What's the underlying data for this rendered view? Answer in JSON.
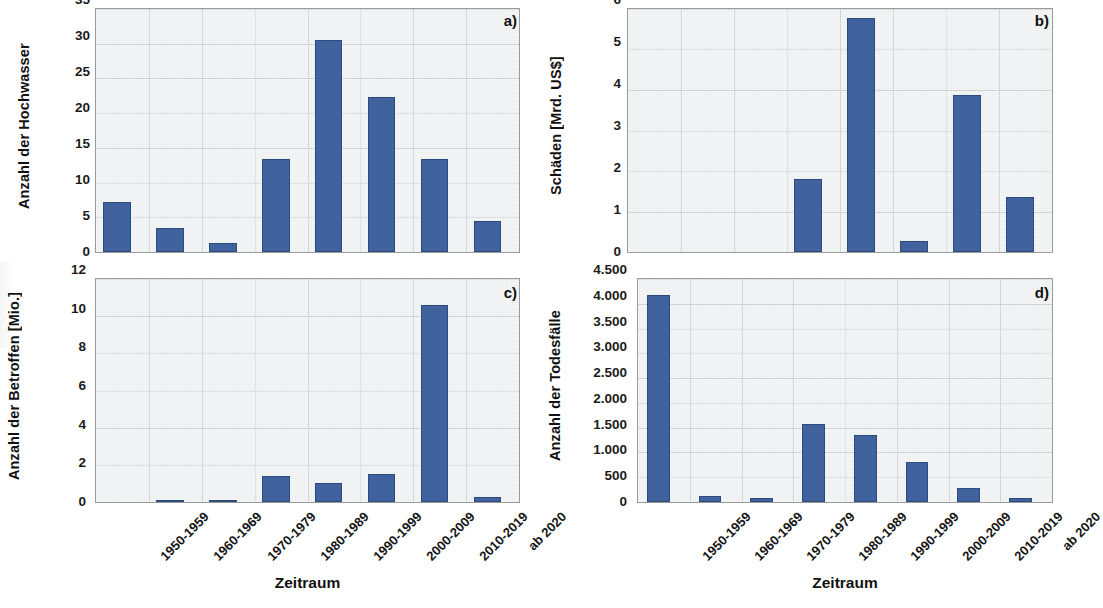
{
  "figure": {
    "bar_color": "#40639f",
    "bar_edge_color": "#2d4a7c",
    "plot_background": "#eceeef",
    "grid_color": "#c9cbcc",
    "categories": [
      "1950-1959",
      "1960-1969",
      "1970-1979",
      "1980-1989",
      "1990-1999",
      "2000-2009",
      "2010-2019",
      "ab 2020"
    ]
  },
  "panels": {
    "a": {
      "tag": "a)",
      "ylabel": "Anzahl der Hochwasser",
      "yticks": [
        "0",
        "5",
        "10",
        "15",
        "20",
        "25",
        "30",
        "35"
      ]
    },
    "b": {
      "tag": "b)",
      "ylabel": "Schäden [Mrd. US$]",
      "yticks": [
        "0",
        "1",
        "2",
        "3",
        "4",
        "5",
        "6"
      ]
    },
    "c": {
      "tag": "c)",
      "ylabel": "Anzahl der Betroffen [Mio.]",
      "yticks": [
        "0",
        "2",
        "4",
        "6",
        "8",
        "10",
        "12"
      ],
      "xtitle": "Zeitraum"
    },
    "d": {
      "tag": "d)",
      "ylabel": "Anzahl der Todesfälle",
      "yticks": [
        "0",
        "500",
        "1.000",
        "1.500",
        "2.000",
        "2.500",
        "3.000",
        "3.500",
        "4.000",
        "4.500"
      ],
      "xtitle": "Zeitraum"
    }
  },
  "chart_data": [
    {
      "type": "bar",
      "panel": "a",
      "title": "a)",
      "xlabel": "Zeitraum",
      "ylabel": "Anzahl der Hochwasser",
      "categories": [
        "1950-1959",
        "1960-1969",
        "1970-1979",
        "1980-1989",
        "1990-1999",
        "2000-2009",
        "2010-2019",
        "ab 2020"
      ],
      "values": [
        7.2,
        3.4,
        1.3,
        13.4,
        30.5,
        22.3,
        13.4,
        4.5
      ],
      "ylim": [
        0,
        35
      ],
      "ytick_values": [
        0,
        5,
        10,
        15,
        20,
        25,
        30,
        35
      ],
      "grid": true,
      "legend": "none"
    },
    {
      "type": "bar",
      "panel": "b",
      "title": "b)",
      "xlabel": "Zeitraum",
      "ylabel": "Schäden [Mrd. US$]",
      "categories": [
        "1950-1959",
        "1960-1969",
        "1970-1979",
        "1980-1989",
        "1990-1999",
        "2000-2009",
        "2010-2019",
        "ab 2020"
      ],
      "values": [
        0,
        0,
        0,
        1.8,
        5.78,
        0.27,
        3.88,
        1.35
      ],
      "ylim": [
        0,
        6
      ],
      "ytick_values": [
        0,
        1,
        2,
        3,
        4,
        5,
        6
      ],
      "grid": true,
      "legend": "none"
    },
    {
      "type": "bar",
      "panel": "c",
      "title": "c)",
      "xlabel": "Zeitraum",
      "ylabel": "Anzahl der Betroffen [Mio.]",
      "categories": [
        "1950-1959",
        "1960-1969",
        "1970-1979",
        "1980-1989",
        "1990-1999",
        "2000-2009",
        "2010-2019",
        "ab 2020"
      ],
      "values": [
        0,
        0.08,
        0.08,
        1.4,
        1.05,
        1.5,
        10.6,
        0.25
      ],
      "ylim": [
        0,
        12
      ],
      "ytick_values": [
        0,
        2,
        4,
        6,
        8,
        10,
        12
      ],
      "grid": true,
      "legend": "none"
    },
    {
      "type": "bar",
      "panel": "d",
      "title": "d)",
      "xlabel": "Zeitraum",
      "ylabel": "Anzahl der Todesfälle",
      "categories": [
        "1950-1959",
        "1960-1969",
        "1970-1979",
        "1980-1989",
        "1990-1999",
        "2000-2009",
        "2010-2019",
        "ab 2020"
      ],
      "values": [
        4180,
        130,
        75,
        1570,
        1360,
        800,
        280,
        75
      ],
      "ylim": [
        0,
        4500
      ],
      "ytick_values": [
        0,
        500,
        1000,
        1500,
        2000,
        2500,
        3000,
        3500,
        4000,
        4500
      ],
      "grid": true,
      "legend": "none"
    }
  ]
}
